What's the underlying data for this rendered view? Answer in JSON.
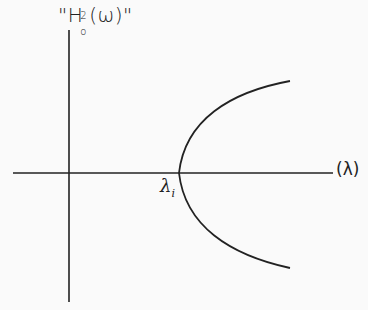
{
  "diagram": {
    "y_axis_label": {
      "open_quote": "\"",
      "letter": "H",
      "superscript": "2",
      "subscript": "o",
      "arg": "(ω)",
      "close_quote": "\""
    },
    "x_axis_label": "(λ)",
    "vertex_label": {
      "symbol": "λ",
      "subscript": "i"
    },
    "curve": {
      "type": "parabola opening right",
      "vertex_px": [
        179,
        173
      ],
      "upper_end_px": [
        290,
        81
      ],
      "lower_end_px": [
        290,
        268
      ]
    },
    "axes": {
      "horizontal": {
        "x1": 13,
        "x2": 333,
        "y": 173
      },
      "vertical": {
        "x": 69,
        "y1": 30,
        "y2": 302
      }
    },
    "line_color": "#222222",
    "background": "#fafafa"
  }
}
